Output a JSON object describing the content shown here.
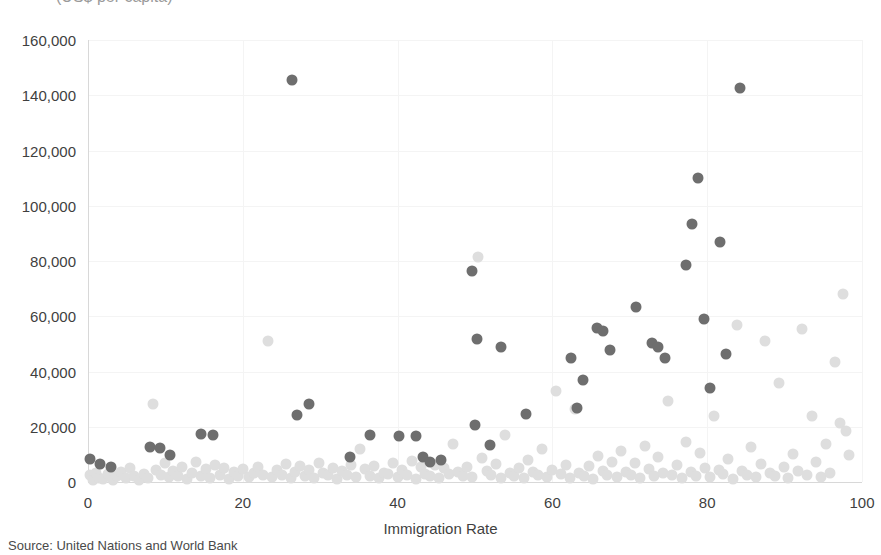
{
  "subtitle_clipped": "(US$ per capita)",
  "source_note": "Source: United Nations and World Bank",
  "axis": {
    "x_label": "Immigration Rate",
    "y_label": "",
    "x_ticks": [
      "0",
      "20",
      "40",
      "60",
      "80",
      "100"
    ],
    "y_ticks": [
      "0",
      "20,000",
      "40,000",
      "60,000",
      "80,000",
      "100,000",
      "120,000",
      "140,000",
      "160,000"
    ]
  },
  "colors": {
    "foreground_point": "#6e6e6e",
    "background_point": "#dedede",
    "gridline": "#f4f4f4",
    "axis_line": "#d8d8d8",
    "text": "#3f3f3f"
  },
  "chart_data": {
    "type": "scatter",
    "title": "",
    "subtitle": "(US$ per capita)",
    "xlabel": "Immigration Rate",
    "ylabel": "",
    "xlim": [
      0,
      100
    ],
    "ylim": [
      0,
      160000
    ],
    "xticks": [
      0,
      20,
      40,
      60,
      80,
      100
    ],
    "yticks": [
      0,
      20000,
      40000,
      60000,
      80000,
      100000,
      120000,
      140000,
      160000
    ],
    "grid": true,
    "legend": "none",
    "source": "Source: United Nations and World Bank",
    "series": [
      {
        "name": "highlighted",
        "color": "#6e6e6e",
        "marker_size": 11,
        "points": [
          [
            0.3,
            8200
          ],
          [
            1.6,
            6500
          ],
          [
            3.0,
            5600
          ],
          [
            8.0,
            12800
          ],
          [
            9.3,
            12200
          ],
          [
            10.6,
            9600
          ],
          [
            14.6,
            17400
          ],
          [
            16.2,
            16900
          ],
          [
            26.4,
            145500
          ],
          [
            27.0,
            24400
          ],
          [
            28.6,
            28300
          ],
          [
            33.8,
            9000
          ],
          [
            36.4,
            16900
          ],
          [
            40.2,
            16700
          ],
          [
            42.4,
            16600
          ],
          [
            43.3,
            8900
          ],
          [
            44.2,
            7300
          ],
          [
            45.6,
            8000
          ],
          [
            49.6,
            76500
          ],
          [
            50.3,
            51700
          ],
          [
            50.0,
            20600
          ],
          [
            51.9,
            13400
          ],
          [
            53.3,
            48800
          ],
          [
            56.6,
            24600
          ],
          [
            62.4,
            44900
          ],
          [
            63.2,
            26900
          ],
          [
            64.0,
            37000
          ],
          [
            65.8,
            55700
          ],
          [
            66.6,
            54600
          ],
          [
            67.4,
            47800
          ],
          [
            70.8,
            63500
          ],
          [
            72.9,
            50300
          ],
          [
            73.6,
            48900
          ],
          [
            74.6,
            44900
          ],
          [
            77.3,
            78700
          ],
          [
            78.0,
            93500
          ],
          [
            78.8,
            110200
          ],
          [
            79.6,
            58900
          ],
          [
            80.4,
            34100
          ],
          [
            81.6,
            86700
          ],
          [
            82.4,
            46300
          ],
          [
            84.3,
            142800
          ]
        ]
      },
      {
        "name": "all-countries",
        "color": "#dedede",
        "marker_size": 11,
        "points": [
          [
            0.2,
            2400
          ],
          [
            0.6,
            900
          ],
          [
            1.0,
            3400
          ],
          [
            1.4,
            1600
          ],
          [
            2.0,
            1100
          ],
          [
            2.6,
            2800
          ],
          [
            3.2,
            900
          ],
          [
            3.8,
            2000
          ],
          [
            4.3,
            3800
          ],
          [
            4.9,
            1300
          ],
          [
            5.4,
            5200
          ],
          [
            6.0,
            2100
          ],
          [
            6.6,
            900
          ],
          [
            7.2,
            3000
          ],
          [
            7.8,
            1500
          ],
          [
            8.4,
            28400
          ],
          [
            8.8,
            4400
          ],
          [
            9.4,
            2600
          ],
          [
            10.0,
            6900
          ],
          [
            10.5,
            1800
          ],
          [
            11.0,
            4100
          ],
          [
            11.6,
            2300
          ],
          [
            12.2,
            5600
          ],
          [
            12.8,
            1200
          ],
          [
            13.4,
            3300
          ],
          [
            14.0,
            7300
          ],
          [
            14.6,
            2000
          ],
          [
            15.2,
            4600
          ],
          [
            15.8,
            1400
          ],
          [
            16.4,
            6100
          ],
          [
            17.0,
            2700
          ],
          [
            17.6,
            5000
          ],
          [
            18.2,
            1000
          ],
          [
            18.8,
            3600
          ],
          [
            19.4,
            2200
          ],
          [
            20.0,
            4800
          ],
          [
            20.8,
            1700
          ],
          [
            21.4,
            3100
          ],
          [
            22.0,
            5400
          ],
          [
            22.6,
            2400
          ],
          [
            23.2,
            51200
          ],
          [
            23.8,
            1900
          ],
          [
            24.4,
            4200
          ],
          [
            25.0,
            2600
          ],
          [
            25.6,
            6600
          ],
          [
            26.2,
            1300
          ],
          [
            26.8,
            3800
          ],
          [
            27.4,
            5700
          ],
          [
            28.0,
            2100
          ],
          [
            28.6,
            4400
          ],
          [
            29.2,
            1600
          ],
          [
            29.8,
            7000
          ],
          [
            30.4,
            3200
          ],
          [
            31.0,
            2400
          ],
          [
            31.6,
            5100
          ],
          [
            32.2,
            1100
          ],
          [
            32.8,
            3900
          ],
          [
            33.4,
            2700
          ],
          [
            34.0,
            6300
          ],
          [
            34.6,
            1800
          ],
          [
            35.2,
            12100
          ],
          [
            35.8,
            4600
          ],
          [
            36.4,
            2200
          ],
          [
            37.0,
            5800
          ],
          [
            37.6,
            1400
          ],
          [
            38.2,
            3400
          ],
          [
            38.8,
            2900
          ],
          [
            39.4,
            6800
          ],
          [
            40.0,
            1700
          ],
          [
            40.6,
            4300
          ],
          [
            41.2,
            2500
          ],
          [
            41.8,
            7600
          ],
          [
            42.4,
            1200
          ],
          [
            43.0,
            5300
          ],
          [
            43.6,
            3000
          ],
          [
            44.2,
            2000
          ],
          [
            44.8,
            6000
          ],
          [
            45.4,
            1500
          ],
          [
            46.0,
            4900
          ],
          [
            46.6,
            2800
          ],
          [
            47.2,
            13800
          ],
          [
            47.8,
            3600
          ],
          [
            48.4,
            2300
          ],
          [
            49.0,
            5500
          ],
          [
            49.6,
            1900
          ],
          [
            50.4,
            81400
          ],
          [
            50.9,
            8800
          ],
          [
            51.5,
            4000
          ],
          [
            52.1,
            2600
          ],
          [
            52.7,
            6400
          ],
          [
            53.3,
            1600
          ],
          [
            53.9,
            17100
          ],
          [
            54.5,
            3300
          ],
          [
            55.1,
            2100
          ],
          [
            55.7,
            5000
          ],
          [
            56.3,
            1300
          ],
          [
            56.9,
            7800
          ],
          [
            57.5,
            3700
          ],
          [
            58.1,
            2500
          ],
          [
            58.7,
            11900
          ],
          [
            59.3,
            1800
          ],
          [
            59.9,
            4500
          ],
          [
            60.5,
            33000
          ],
          [
            61.1,
            2900
          ],
          [
            61.7,
            6200
          ],
          [
            62.3,
            1500
          ],
          [
            62.9,
            26300
          ],
          [
            63.5,
            3400
          ],
          [
            64.1,
            2200
          ],
          [
            64.7,
            5900
          ],
          [
            65.3,
            1100
          ],
          [
            65.9,
            9400
          ],
          [
            66.5,
            4100
          ],
          [
            67.1,
            2700
          ],
          [
            67.7,
            7200
          ],
          [
            68.3,
            1700
          ],
          [
            68.9,
            11200
          ],
          [
            69.5,
            3800
          ],
          [
            70.1,
            2400
          ],
          [
            70.7,
            6700
          ],
          [
            71.3,
            1400
          ],
          [
            71.9,
            13100
          ],
          [
            72.5,
            4700
          ],
          [
            73.1,
            2000
          ],
          [
            73.7,
            9000
          ],
          [
            74.3,
            3100
          ],
          [
            74.9,
            29400
          ],
          [
            75.5,
            2600
          ],
          [
            76.1,
            6000
          ],
          [
            76.7,
            1600
          ],
          [
            77.3,
            14300
          ],
          [
            77.9,
            3500
          ],
          [
            78.5,
            2300
          ],
          [
            79.1,
            10600
          ],
          [
            79.7,
            5200
          ],
          [
            80.3,
            1900
          ],
          [
            80.9,
            24000
          ],
          [
            81.5,
            4300
          ],
          [
            82.1,
            2800
          ],
          [
            82.7,
            8200
          ],
          [
            83.3,
            1200
          ],
          [
            83.9,
            56800
          ],
          [
            84.5,
            3900
          ],
          [
            85.1,
            2500
          ],
          [
            85.7,
            12600
          ],
          [
            86.3,
            1800
          ],
          [
            86.9,
            6500
          ],
          [
            87.5,
            51100
          ],
          [
            88.1,
            3200
          ],
          [
            88.7,
            2100
          ],
          [
            89.3,
            35700
          ],
          [
            89.9,
            5600
          ],
          [
            90.5,
            1500
          ],
          [
            91.1,
            10200
          ],
          [
            91.7,
            4000
          ],
          [
            92.3,
            55400
          ],
          [
            92.9,
            2600
          ],
          [
            93.5,
            23900
          ],
          [
            94.1,
            7400
          ],
          [
            94.7,
            1700
          ],
          [
            95.3,
            13900
          ],
          [
            95.9,
            3400
          ],
          [
            96.5,
            43600
          ],
          [
            97.1,
            21400
          ],
          [
            97.5,
            68000
          ],
          [
            97.9,
            18300
          ],
          [
            98.3,
            9600
          ]
        ]
      }
    ]
  }
}
